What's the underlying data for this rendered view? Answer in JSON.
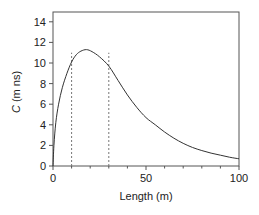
{
  "chart_data": {
    "type": "line",
    "title": "",
    "xlabel": "Length (m)",
    "ylabel_italic": "C",
    "ylabel_rest": " (m ns)",
    "ylabel": "C (m ns)",
    "xlim": [
      0,
      100
    ],
    "ylim": [
      0,
      15
    ],
    "x_ticks": [
      0,
      50,
      100
    ],
    "x_minor_ticks": [
      10,
      20,
      30,
      40,
      60,
      70,
      80,
      90
    ],
    "y_ticks": [
      0,
      2,
      4,
      6,
      8,
      10,
      12,
      14
    ],
    "grid": false,
    "legend": null,
    "series": [
      {
        "name": "C",
        "x": [
          0,
          0.5,
          1.5,
          3,
          5,
          7.5,
          10,
          12.5,
          15,
          18,
          21,
          25,
          30,
          35,
          40,
          45,
          50,
          55,
          60,
          65,
          70,
          75,
          80,
          85,
          90,
          95,
          100
        ],
        "values": [
          0,
          2.0,
          4.2,
          6.0,
          7.6,
          9.0,
          10.1,
          10.8,
          11.15,
          11.3,
          11.1,
          10.6,
          9.7,
          8.3,
          6.9,
          5.7,
          4.7,
          4.0,
          3.3,
          2.7,
          2.2,
          1.8,
          1.5,
          1.25,
          1.05,
          0.85,
          0.7
        ]
      }
    ],
    "annotations": [
      {
        "type": "vline",
        "style": "dashed",
        "x": 10,
        "y_top": 11.0
      },
      {
        "type": "vline",
        "style": "dashed",
        "x": 30,
        "y_top": 11.0
      }
    ]
  },
  "colors": {
    "line": "#333333",
    "axis": "#555555",
    "dashed": "#777777"
  }
}
